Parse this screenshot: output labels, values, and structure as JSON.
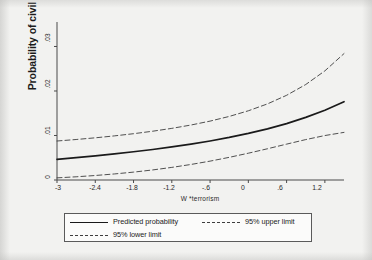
{
  "chart_data": {
    "type": "line",
    "title": "",
    "xlabel": "W *terrorism",
    "ylabel": "Probability of civil liberties",
    "xlim": [
      -3.0,
      1.5
    ],
    "ylim": [
      0,
      0.0355
    ],
    "xticks": [
      "-3",
      "-2.4",
      "-1.8",
      "-1.2",
      "-.6",
      "0",
      ".6",
      "1.2"
    ],
    "xtick_values": [
      -3,
      -2.4,
      -1.8,
      -1.2,
      -0.6,
      0,
      0.6,
      1.2
    ],
    "yticks": [
      "0",
      ".01",
      ".02",
      ".03"
    ],
    "ytick_values": [
      0,
      0.01,
      0.02,
      0.03
    ],
    "grid": false,
    "legend_position": "bottom",
    "x": [
      -3.0,
      -2.7,
      -2.4,
      -2.1,
      -1.8,
      -1.5,
      -1.2,
      -0.9,
      -0.6,
      -0.3,
      0.0,
      0.3,
      0.6,
      0.9,
      1.2,
      1.5
    ],
    "series": [
      {
        "name": "Predicted probability",
        "style": "solid",
        "color": "#1a1a1a",
        "values": [
          0.00465,
          0.00502,
          0.00542,
          0.00586,
          0.00634,
          0.00686,
          0.00743,
          0.00806,
          0.00877,
          0.00956,
          0.01046,
          0.01149,
          0.01268,
          0.01406,
          0.01568,
          0.0176
        ]
      },
      {
        "name": "95% upper limit",
        "style": "dashed",
        "color": "#3d3d3d",
        "values": [
          0.00876,
          0.0091,
          0.00948,
          0.00991,
          0.0104,
          0.01096,
          0.0116,
          0.01235,
          0.01323,
          0.01428,
          0.01555,
          0.0171,
          0.01903,
          0.02145,
          0.02452,
          0.0284
        ]
      },
      {
        "name": "95% lower limit",
        "style": "dashed",
        "color": "#3d3d3d",
        "values": [
          0.00048,
          0.00072,
          0.00101,
          0.00136,
          0.00177,
          0.00226,
          0.00283,
          0.00349,
          0.00424,
          0.00509,
          0.00602,
          0.00702,
          0.00806,
          0.00908,
          0.00999,
          0.0107
        ]
      }
    ],
    "legend_entries": [
      {
        "label": "Predicted probability",
        "style": "solid"
      },
      {
        "label": "95% lower limit",
        "style": "dashed"
      },
      {
        "label": "95% upper limit",
        "style": "dashed"
      }
    ]
  }
}
